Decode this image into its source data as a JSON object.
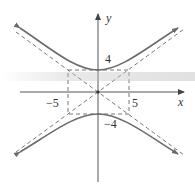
{
  "diagram": {
    "type": "hyperbola",
    "equation": "y^2/16 - x^2/25 = 1",
    "axes": {
      "x_label": "x",
      "y_label": "y"
    },
    "tick_labels": {
      "x_neg": "−5",
      "x_pos": "5",
      "y_pos": "4",
      "y_neg": "−4"
    },
    "vertices": [
      [
        0,
        4
      ],
      [
        0,
        -4
      ]
    ],
    "box": {
      "x": [
        -5,
        5
      ],
      "y": [
        -4,
        4
      ]
    },
    "asymptotes": [
      "y = 4x/5",
      "y = -4x/5"
    ],
    "colors": {
      "curve": "#6b6b6b",
      "asymptote": "#555555",
      "axis": "#444444",
      "label": "#333333"
    }
  }
}
